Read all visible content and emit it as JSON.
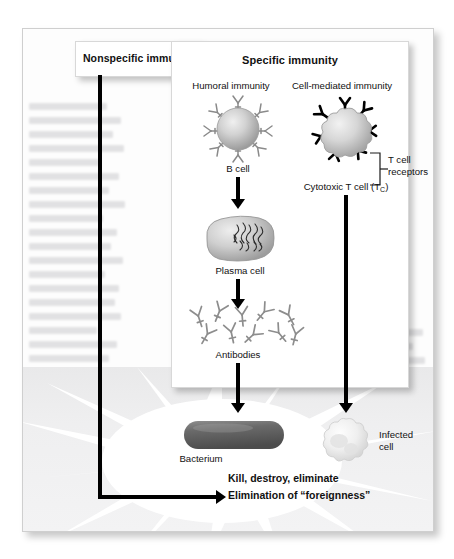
{
  "figure": {
    "branches": {
      "nonspecific": {
        "title": "Nonspecific immunity"
      },
      "specific": {
        "title": "Specific immunity",
        "arms": [
          {
            "label": "Humoral immunity"
          },
          {
            "label": "Cell-mediated immunity"
          }
        ]
      }
    },
    "cells": {
      "b_cell": {
        "caption": "B cell"
      },
      "plasma_cell": {
        "caption": "Plasma cell"
      },
      "antibodies": {
        "caption": "Antibodies"
      },
      "t_cell": {
        "caption": "Cytotoxic T cell (T",
        "caption_sub": "C",
        "caption_end": ")"
      },
      "t_receptors": {
        "line1": "T cell",
        "line2": "receptors"
      },
      "bacterium": {
        "caption": "Bacterium"
      },
      "infected_cell": {
        "line1": "Infected",
        "line2": "cell"
      }
    },
    "outcome": {
      "line1": "Kill, destroy, eliminate",
      "line2": "Elimination of “foreignness”"
    },
    "colors": {
      "ink": "#000000",
      "panel_bg": "#ffffff",
      "panel_border": "#d8d8d8",
      "cell_light": "#dcdcdc",
      "cell_mid": "#b4b4b4",
      "cell_dark": "#8f8f8f",
      "bacterium_dark": "#5d5d5d",
      "bacterium_light": "#8d8d8d",
      "infected_cell": "#ececec",
      "lower_band": "#eeeeef",
      "starburst": "#ffffff"
    }
  }
}
